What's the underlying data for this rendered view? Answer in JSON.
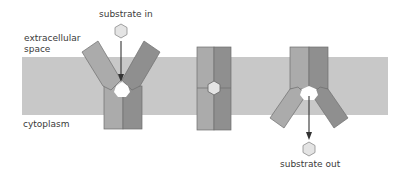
{
  "diagram": {
    "type": "membrane-transporter-mechanism",
    "labels": {
      "extracellular_line1": "extracellular",
      "extracellular_line2": "space",
      "cytoplasm": "cytoplasm",
      "substrate_in": "substrate in",
      "substrate_out": "substrate out"
    },
    "states": [
      {
        "name": "outward-open",
        "substrate_position": "entering from extracellular space"
      },
      {
        "name": "occluded",
        "substrate_position": "bound in center"
      },
      {
        "name": "inward-open",
        "substrate_position": "released into cytoplasm"
      }
    ],
    "colors": {
      "membrane": "#c8c8c8",
      "subunit_light": "#ababab",
      "subunit_dark": "#8f8f8f",
      "outline": "#6e6e6e",
      "substrate_fill": "#e4e4e4",
      "arrow": "#333333",
      "text": "#3a3a3a"
    }
  }
}
